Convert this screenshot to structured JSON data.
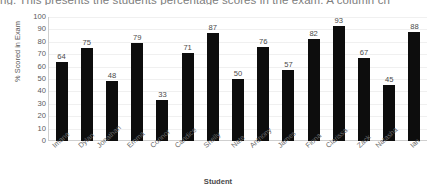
{
  "document": {
    "header_text": "ng. This presents the students percentage scores in the exam. A column ch"
  },
  "chart_data": {
    "type": "bar",
    "title": "",
    "xlabel": "Student",
    "ylabel": "% Scored in Exam",
    "categories": [
      "Imane",
      "Dylan",
      "Jonathan",
      "Emma",
      "Connor",
      "Candice",
      "Shelly",
      "Nate",
      "Anthony",
      "James",
      "Fiona",
      "Clarissa",
      "Zack",
      "Natasha",
      "Ian"
    ],
    "values": [
      64,
      75,
      48,
      79,
      33,
      71,
      87,
      50,
      76,
      57,
      82,
      93,
      67,
      45,
      88
    ],
    "ylim": [
      0,
      100
    ],
    "ytick_labels": [
      "100",
      "90",
      "80",
      "70",
      "60",
      "50",
      "40",
      "30",
      "20",
      "10",
      "0"
    ],
    "ytick_values": [
      100,
      90,
      80,
      70,
      60,
      50,
      40,
      30,
      20,
      10,
      0
    ],
    "grid": true,
    "legend": "none",
    "data_labels": true,
    "bar_color": "#0D0D0D",
    "grid_color": "#F0F0F0",
    "axis_color": "#CFCFCF",
    "text_color": "#5A5A5A"
  }
}
